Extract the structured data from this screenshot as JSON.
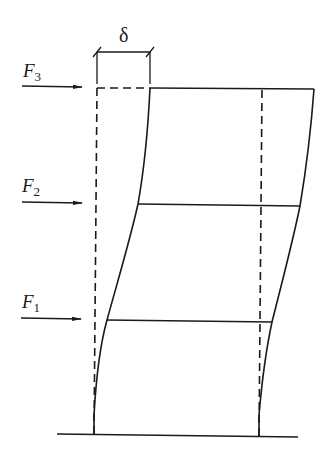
{
  "diagram": {
    "colors": {
      "stroke": "#1a1a1a",
      "background": "#ffffff"
    },
    "displacement_label": "δ",
    "forces": [
      {
        "name": "F3",
        "symbol": "F",
        "subscript": "3",
        "level": "top"
      },
      {
        "name": "F2",
        "symbol": "F",
        "subscript": "2",
        "level": "middle"
      },
      {
        "name": "F1",
        "symbol": "F",
        "subscript": "1",
        "level": "bottom"
      }
    ],
    "elements": {
      "original_frame": "dashed",
      "deformed_frame": "solid",
      "floors": 3,
      "ground": "solid line"
    }
  }
}
